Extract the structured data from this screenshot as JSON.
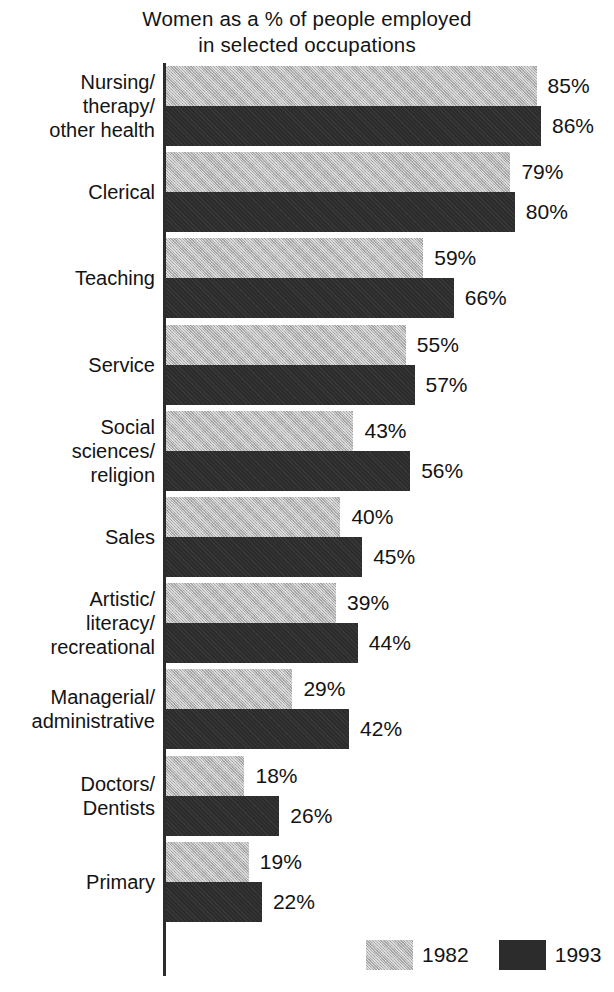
{
  "chart_data": {
    "type": "bar",
    "orientation": "horizontal",
    "title": "Women as a % of people employed in selected occupations",
    "title_lines": [
      "Women as a % of people employed",
      "in selected occupations"
    ],
    "xlabel": "",
    "ylabel": "",
    "xlim": [
      0,
      100
    ],
    "grid": false,
    "legend_position": "bottom-right",
    "unit": "%",
    "categories": [
      "Nursing/\ntherapy/\nother health",
      "Clerical",
      "Teaching",
      "Service",
      "Social\nsciences/\nreligion",
      "Sales",
      "Artistic/\nliteracy/\nrecreational",
      "Managerial/\nadministrative",
      "Doctors/\nDentists",
      "Primary"
    ],
    "series": [
      {
        "name": "1982",
        "color": "#b4b4b4",
        "values": [
          85,
          79,
          59,
          55,
          43,
          40,
          39,
          29,
          18,
          19
        ],
        "labels": [
          "85%",
          "79%",
          "59%",
          "55%",
          "43%",
          "40%",
          "39%",
          "29%",
          "18%",
          "19%"
        ]
      },
      {
        "name": "1993",
        "color": "#2c2c2c",
        "values": [
          86,
          80,
          66,
          57,
          56,
          45,
          44,
          42,
          26,
          22
        ],
        "labels": [
          "86%",
          "80%",
          "66%",
          "57%",
          "56%",
          "45%",
          "44%",
          "42%",
          "26%",
          "22%"
        ]
      }
    ]
  },
  "legend": {
    "items": [
      {
        "label": "1982",
        "swatch": "light-gray-hatched-swatch"
      },
      {
        "label": "1993",
        "swatch": "dark-solid-swatch"
      }
    ]
  }
}
